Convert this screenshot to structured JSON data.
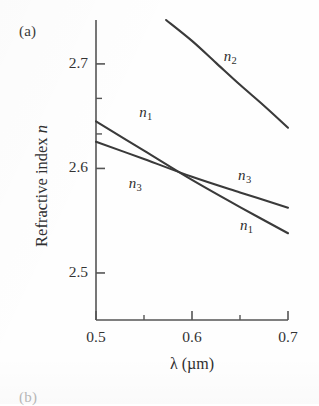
{
  "figure": {
    "panel_label": "(a)",
    "next_panel_label": "(b)",
    "background_color": "#fefefe",
    "line_color": "#3a3a3a",
    "axis_color": "#555555"
  },
  "chart_data": {
    "type": "line",
    "title": "",
    "xlabel": "λ (µm)",
    "ylabel": "Refractive index n",
    "xlim": [
      0.5,
      0.7
    ],
    "ylim": [
      2.455,
      2.742
    ],
    "grid": false,
    "legend": "inline-annotations",
    "xticks": [
      0.5,
      0.6,
      0.7
    ],
    "xtick_labels": [
      "0.5",
      "0.6",
      "0.7"
    ],
    "x_minor_ticks": [
      0.55,
      0.65
    ],
    "yticks": [
      2.5,
      2.6,
      2.7
    ],
    "ytick_labels": [
      "2.5",
      "2.6",
      "2.7"
    ],
    "y_minor_ticks": [
      2.633,
      2.667
    ],
    "series": [
      {
        "name": "n2",
        "label": "n",
        "sublabel": "2",
        "x": [
          0.573,
          0.6,
          0.625,
          0.65,
          0.675,
          0.7
        ],
        "values": [
          2.742,
          2.722,
          2.701,
          2.68,
          2.66,
          2.639
        ]
      },
      {
        "name": "n1",
        "label": "n",
        "sublabel": "1",
        "x": [
          0.5,
          0.55,
          0.6,
          0.65,
          0.7
        ],
        "values": [
          2.645,
          2.617,
          2.589,
          2.563,
          2.538
        ]
      },
      {
        "name": "n3",
        "label": "n",
        "sublabel": "3",
        "x": [
          0.5,
          0.55,
          0.6,
          0.65,
          0.7
        ],
        "values": [
          2.6255,
          2.609,
          2.592,
          2.577,
          2.5625
        ]
      }
    ],
    "annotations": [
      {
        "name": "n2-label",
        "text": "n",
        "sub": "2",
        "x": 0.633,
        "y": 2.706
      },
      {
        "name": "n1-label-left",
        "text": "n",
        "sub": "1",
        "x": 0.545,
        "y": 2.652
      },
      {
        "name": "n3-label-left",
        "text": "n",
        "sub": "3",
        "x": 0.534,
        "y": 2.584
      },
      {
        "name": "n3-label-right",
        "text": "n",
        "sub": "3",
        "x": 0.648,
        "y": 2.592
      },
      {
        "name": "n1-label-right",
        "text": "n",
        "sub": "1",
        "x": 0.65,
        "y": 2.544
      }
    ],
    "crossing_point": {
      "x": 0.59,
      "y": 2.594
    }
  }
}
